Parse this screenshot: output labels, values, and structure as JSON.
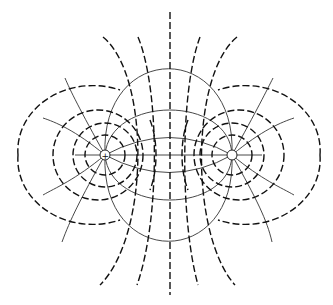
{
  "diagram": {
    "charges": [
      {
        "sign": "+",
        "label": "+",
        "x": 105,
        "y": 155
      },
      {
        "sign": "-",
        "label": "−",
        "x": 232,
        "y": 155
      }
    ],
    "field_line_style": "solid with arrowheads (positive to negative)",
    "equipotential_style": "dashed",
    "colors": {
      "line": "#222222",
      "background": "#ffffff"
    }
  }
}
